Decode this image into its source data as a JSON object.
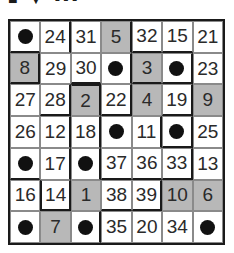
{
  "title_fragment": "■ ▼ ▪▪▪",
  "colors": {
    "shaded": "#b8b8b8",
    "line": "#1a1a1a",
    "dot": "#111111"
  },
  "grid": {
    "rows": 7,
    "cols": 7,
    "cells": [
      [
        {
          "v": "•",
          "dot": true
        },
        {
          "v": "24"
        },
        {
          "v": "31"
        },
        {
          "v": "5",
          "shaded": true
        },
        {
          "v": "32"
        },
        {
          "v": "15"
        },
        {
          "v": "21"
        }
      ],
      [
        {
          "v": "8",
          "shaded": true
        },
        {
          "v": "29"
        },
        {
          "v": "30"
        },
        {
          "v": "•",
          "dot": true
        },
        {
          "v": "3",
          "shaded": true
        },
        {
          "v": "•",
          "dot": true
        },
        {
          "v": "23"
        }
      ],
      [
        {
          "v": "27"
        },
        {
          "v": "28"
        },
        {
          "v": "2",
          "shaded": true
        },
        {
          "v": "22"
        },
        {
          "v": "4",
          "shaded": true
        },
        {
          "v": "19"
        },
        {
          "v": "9",
          "shaded": true
        }
      ],
      [
        {
          "v": "26"
        },
        {
          "v": "12"
        },
        {
          "v": "18"
        },
        {
          "v": "•",
          "dot": true
        },
        {
          "v": "11"
        },
        {
          "v": "•",
          "dot": true
        },
        {
          "v": "25"
        }
      ],
      [
        {
          "v": "•",
          "dot": true
        },
        {
          "v": "17"
        },
        {
          "v": "•",
          "dot": true
        },
        {
          "v": "37"
        },
        {
          "v": "36"
        },
        {
          "v": "33"
        },
        {
          "v": "13"
        }
      ],
      [
        {
          "v": "16"
        },
        {
          "v": "14"
        },
        {
          "v": "1",
          "shaded": true
        },
        {
          "v": "38"
        },
        {
          "v": "39"
        },
        {
          "v": "10",
          "shaded": true
        },
        {
          "v": "6",
          "shaded": true
        }
      ],
      [
        {
          "v": "•",
          "dot": true
        },
        {
          "v": "7",
          "shaded": true
        },
        {
          "v": "•",
          "dot": true
        },
        {
          "v": "35"
        },
        {
          "v": "20"
        },
        {
          "v": "34"
        },
        {
          "v": "•",
          "dot": true
        }
      ]
    ]
  }
}
